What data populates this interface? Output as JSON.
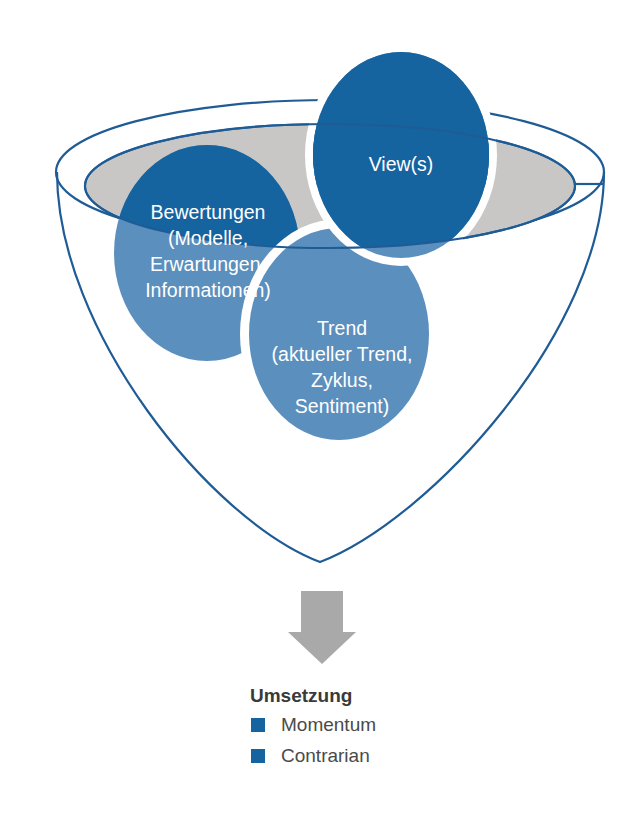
{
  "diagram": {
    "title_visible": false,
    "colors": {
      "dark_blue": "#15639F",
      "mid_blue": "#5B8FBE",
      "gray_ellipse": "#C8C7C5",
      "outline_blue": "#1F5C96",
      "arrow_gray": "#A9A9A9",
      "legend_title_color": "#3a3a3a",
      "legend_text_color": "#4a4a4a",
      "background": "#FFFFFF"
    },
    "bubbles": [
      {
        "name": "views",
        "lines": [
          "View(s)"
        ],
        "fill": "#15639F"
      },
      {
        "name": "bewertungen",
        "lines": [
          "Bewertungen",
          "(Modelle,",
          "Erwartungen,",
          "Informationen)"
        ],
        "fill": "#15639F"
      },
      {
        "name": "trend",
        "lines": [
          "Trend",
          "(aktueller Trend,",
          "Zyklus,",
          "Sentiment)"
        ],
        "fill": "#5B8FBE"
      }
    ],
    "arrow": {
      "name": "down-arrow",
      "direction": "down",
      "color": "#A9A9A9"
    },
    "legend": {
      "title": "Umsetzung",
      "items": [
        {
          "label": "Momentum",
          "swatch_color": "#15639F"
        },
        {
          "label": "Contrarian",
          "swatch_color": "#15639F"
        }
      ]
    }
  }
}
